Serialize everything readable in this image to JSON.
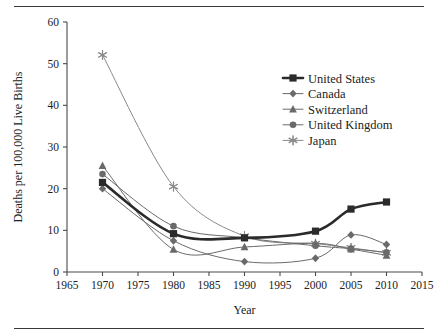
{
  "chart_data": {
    "type": "line",
    "title": "",
    "xlabel": "Year",
    "ylabel": "Deaths per 100,000 Live Births",
    "xlim": [
      1965,
      2015
    ],
    "ylim": [
      0,
      60
    ],
    "xticks": [
      1965,
      1970,
      1975,
      1980,
      1985,
      1990,
      1995,
      2000,
      2005,
      2010,
      2015
    ],
    "yticks": [
      0,
      10,
      20,
      30,
      40,
      50,
      60
    ],
    "grid": false,
    "legend_position": "upper-right",
    "x": [
      1970,
      1980,
      1990,
      2000,
      2005,
      2010
    ],
    "series": [
      {
        "name": "United States",
        "marker": "square",
        "color": "#2b2b2b",
        "line_width": 2.6,
        "values": [
          21.5,
          9.2,
          8.2,
          9.8,
          15.1,
          16.8
        ]
      },
      {
        "name": "Canada",
        "marker": "diamond",
        "color": "#6a6a6a",
        "line_width": 1.0,
        "values": [
          20.0,
          7.5,
          2.5,
          3.3,
          8.9,
          6.6
        ]
      },
      {
        "name": "Switzerland",
        "marker": "triangle",
        "color": "#6a6a6a",
        "line_width": 1.0,
        "values": [
          25.5,
          5.4,
          6.0,
          6.9,
          5.5,
          4.0
        ]
      },
      {
        "name": "United Kingdom",
        "marker": "circle",
        "color": "#6a6a6a",
        "line_width": 1.0,
        "values": [
          23.5,
          11.0,
          8.2,
          6.3,
          5.6,
          4.7
        ]
      },
      {
        "name": "Japan",
        "marker": "asterisk",
        "color": "#8a8a8a",
        "line_width": 1.0,
        "values": [
          52.1,
          20.5,
          8.6,
          6.8,
          5.8,
          4.6
        ]
      }
    ]
  },
  "axes": {
    "x_title": "Year",
    "y_title": "Deaths per 100,000 Live Births",
    "x_tick_labels": [
      "1965",
      "1970",
      "1975",
      "1980",
      "1985",
      "1990",
      "1995",
      "2000",
      "2005",
      "2010",
      "2015"
    ],
    "y_tick_labels": [
      "0",
      "10",
      "20",
      "30",
      "40",
      "50",
      "60"
    ]
  },
  "legend": {
    "entries": [
      {
        "label": "United States"
      },
      {
        "label": "Canada"
      },
      {
        "label": "Switzerland"
      },
      {
        "label": "United Kingdom"
      },
      {
        "label": "Japan"
      }
    ]
  },
  "colors": {
    "axis": "#4a4a4a",
    "primary_series": "#2b2b2b",
    "secondary_series": "#6a6a6a",
    "japan_series": "#8a8a8a",
    "rule": "#3a3a3a"
  }
}
